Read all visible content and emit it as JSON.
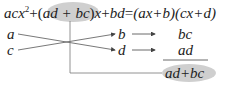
{
  "equation": {
    "lhs_t1": "acx",
    "lhs_t1_exp": "2",
    "plus1": "+",
    "open": "(",
    "middle": "ad + bc",
    "close": ")",
    "lhs_t2": "x",
    "plus2": "+",
    "lhs_t3": "bd",
    "equals": "=",
    "rhs": "(ax+b)(cx+d)"
  },
  "cross": {
    "left_top": "a",
    "left_bottom": "c",
    "right_top": "b",
    "right_bottom": "d"
  },
  "products": {
    "top": "bc",
    "bottom": "ad",
    "sum": "ad+bc"
  },
  "colors": {
    "highlight": "#c8c8c8",
    "line": "#555555"
  }
}
